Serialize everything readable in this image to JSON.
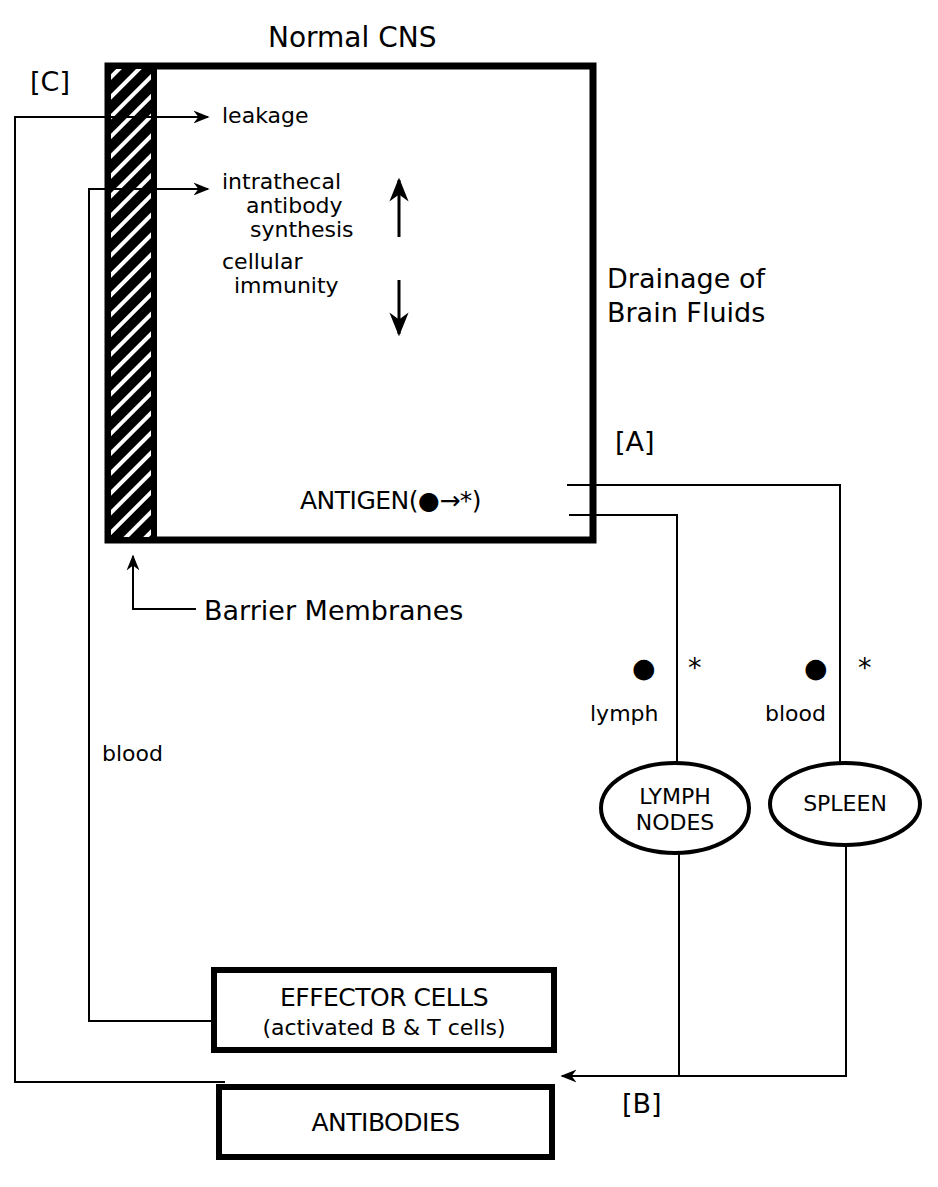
{
  "title": "Normal CNS",
  "markers": {
    "c": "[C]",
    "a": "[A]",
    "b": "[B]"
  },
  "cns_box": {
    "leakage": "leakage",
    "intrathecal": [
      "intrathecal",
      "antibody",
      "synthesis"
    ],
    "cellular": [
      "cellular",
      "immunity"
    ],
    "antigen": "ANTIGEN(●→*)"
  },
  "drainage": [
    "Drainage of",
    "Brain Fluids"
  ],
  "barrier_label": "Barrier Membranes",
  "blood_left": "blood",
  "routes": {
    "lymph": {
      "label": "lymph",
      "dot": "●",
      "star": "*"
    },
    "blood": {
      "label": "blood",
      "dot": "●",
      "star": "*"
    }
  },
  "organs": {
    "lymph_nodes": [
      "LYMPH",
      "NODES"
    ],
    "spleen": "SPLEEN"
  },
  "effector": {
    "line1": "EFFECTOR CELLS",
    "line2": "(activated B & T cells)"
  },
  "antibodies": "ANTIBODIES",
  "colors": {
    "ink": "#000000",
    "paper": "#ffffff"
  }
}
